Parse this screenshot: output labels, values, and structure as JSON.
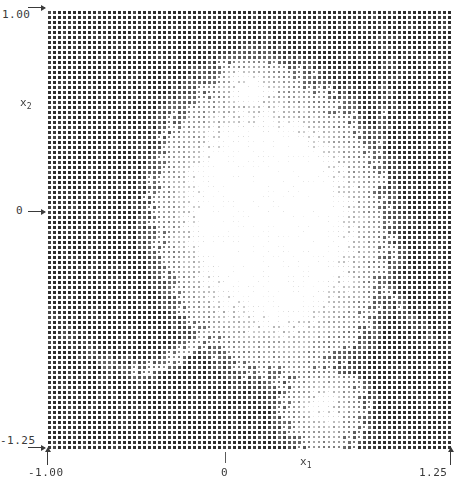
{
  "figure": {
    "title": "",
    "background": "#ffffff",
    "ink": "#2b2b2b"
  },
  "axes": {
    "x": {
      "name": "x",
      "subscript": "1",
      "label": "x₁",
      "min_label": "-1.00",
      "zero_label": "0",
      "max_label": "1.25",
      "min": -1.0,
      "max": 1.25,
      "ticks": [
        -1.0,
        0,
        1.25
      ],
      "tick_labels": [
        "-1.00",
        "0",
        "1.25"
      ]
    },
    "y": {
      "name": "x",
      "subscript": "2",
      "label": "x₂",
      "min_label": "-1.25",
      "zero_label": "0",
      "max_label": "1.00",
      "min": -1.25,
      "max": 1.0,
      "ticks": [
        -1.25,
        0,
        1.0
      ],
      "tick_labels": [
        "-1.25",
        "0",
        "1.00"
      ]
    }
  },
  "chart_data": {
    "type": "heatmap",
    "title": "",
    "xlabel": "x₁",
    "ylabel": "x₂",
    "xlim": [
      -1.0,
      1.25
    ],
    "ylim": [
      -1.25,
      1.0
    ],
    "grid": false,
    "legend": null,
    "rendering": "dot-matrix grid of square markers; marker darkness/size encodes value",
    "marker_shape": "square",
    "marker_pitch_px": 5,
    "grid_cols": 81,
    "grid_rows": 88,
    "value_range": [
      0,
      1
    ],
    "colormap": [
      "#ffffff",
      "#303030"
    ],
    "regions": [
      {
        "name": "dark-background-basin",
        "value": 1.0,
        "shade": "#303030",
        "extent": "entire domain outside the pale lobe"
      },
      {
        "name": "pale-central-lobe",
        "value": 0.18,
        "shade": "#c8c8c8",
        "center_x": 0.2,
        "center_y": -0.15,
        "approx_radius_x": 0.75,
        "approx_radius_y": 0.95
      },
      {
        "name": "pale-upper-notch",
        "value": 0.1,
        "shade": "#dcdcdc",
        "center_x": 0.15,
        "center_y": 0.62,
        "approx_radius_x": 0.32,
        "approx_radius_y": 0.22
      },
      {
        "name": "pale-lower-tail",
        "value": 0.25,
        "shade": "#b4b4b4",
        "center_x": 0.55,
        "center_y": -1.1,
        "approx_radius_x": 0.3,
        "approx_radius_y": 0.3
      }
    ]
  }
}
